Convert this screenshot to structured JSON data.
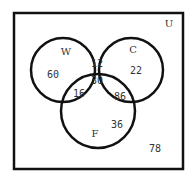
{
  "diagram": {
    "type": "venn-3",
    "universe": {
      "label": "U",
      "outside": "78"
    },
    "sets": [
      {
        "label": "W",
        "only": "60"
      },
      {
        "label": "C",
        "only": "22"
      },
      {
        "label": "F",
        "only": "36"
      }
    ],
    "regions": {
      "W_only": "60",
      "C_only": "22",
      "F_only": "36",
      "W_and_C_only": "12",
      "W_and_F_only": "16",
      "C_and_F_only": "86",
      "W_and_C_and_F": "30",
      "none": "78"
    },
    "colors": {
      "stroke": "#111111",
      "text": "#333333",
      "background": "#ffffff"
    }
  }
}
